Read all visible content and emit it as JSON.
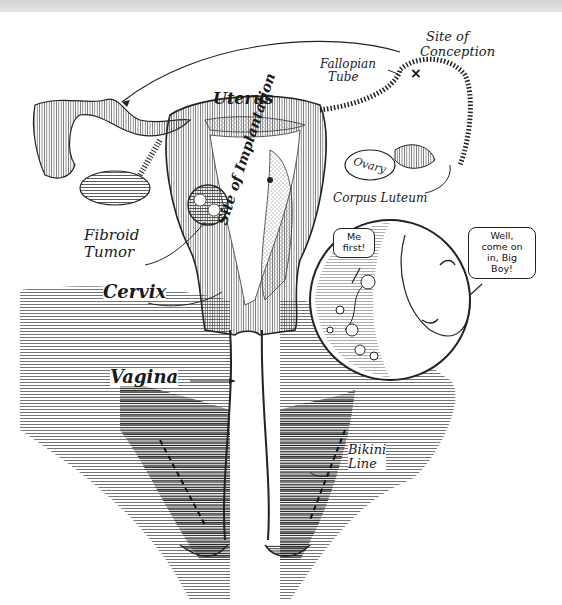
{
  "diagram": {
    "type": "anatomical-illustration",
    "colors": {
      "ink": "#1a1a1a",
      "paper": "#ffffff",
      "shade": "#9a9a9a"
    }
  },
  "labels": {
    "site_of_conception": [
      "Site of",
      "Conception"
    ],
    "fallopian_tube": [
      "Fallopian",
      "Tube"
    ],
    "uterus": "Uterus",
    "site_of_implantation": "Site of Implantation",
    "ovary": "Ovary",
    "corpus_luteum": "Corpus Luteum",
    "fibroid_tumor": [
      "Fibroid",
      "Tumor"
    ],
    "cervix": "Cervix",
    "vagina": "Vagina",
    "bikini_line": [
      "Bikini",
      "Line"
    ]
  },
  "speech_bubbles": {
    "sperm": [
      "Me",
      "first!"
    ],
    "egg": [
      "Well,",
      "come on",
      "in, Big",
      "Boy!"
    ]
  },
  "markers": {
    "conception_mark": "×"
  }
}
